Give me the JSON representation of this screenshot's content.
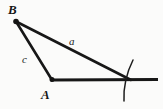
{
  "figure": {
    "kind": "geometry-construction-diagram",
    "background_color": "#fbfbfa",
    "ink_color": "#171717",
    "width": 163,
    "height": 109,
    "vertex_labels": [
      {
        "id": "B",
        "text": "B",
        "x": 8,
        "y": 3
      },
      {
        "id": "A",
        "text": "A",
        "x": 41,
        "y": 88
      }
    ],
    "side_labels": [
      {
        "id": "a",
        "text": "a",
        "x": 69,
        "y": 36
      },
      {
        "id": "c",
        "text": "c",
        "x": 22,
        "y": 54
      }
    ],
    "points": [
      {
        "id": "B",
        "x": 16,
        "y": 21,
        "marker": "filled-dot",
        "radius": 2.6
      },
      {
        "id": "A",
        "x": 52,
        "y": 80,
        "marker": "filled-dot",
        "radius": 2.4
      }
    ],
    "segments": [
      {
        "id": "side-c",
        "from": "B",
        "to": "A",
        "x1": 16,
        "y1": 21,
        "x2": 52,
        "y2": 80,
        "stroke_width": 2.6
      },
      {
        "id": "side-a",
        "from": "B",
        "to": "C",
        "x1": 16,
        "y1": 21,
        "x2": 131,
        "y2": 80,
        "stroke_width": 2.6
      },
      {
        "id": "baseline",
        "from": "A",
        "to": "ray-end",
        "x1": 52,
        "y1": 80,
        "x2": 158,
        "y2": 80,
        "stroke_width": 2.8
      }
    ],
    "arcs": [
      {
        "id": "construction-arc",
        "description": "compass arc crossing the baseline",
        "start_x": 133,
        "start_y": 60,
        "ctrl_x": 123,
        "ctrl_y": 80,
        "end_x": 124,
        "end_y": 101,
        "stroke_width": 1.5
      }
    ]
  }
}
